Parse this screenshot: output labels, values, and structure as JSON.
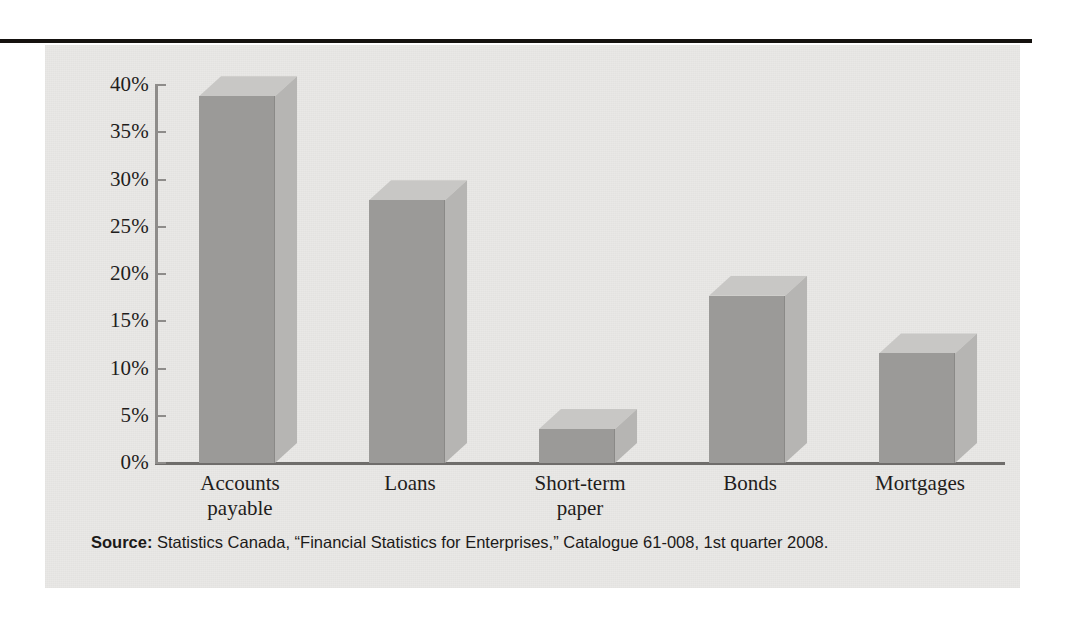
{
  "figure": {
    "background_color": "#e9e8e6",
    "rule_color": "#15120f"
  },
  "source": {
    "label": "Source:",
    "text": " Statistics Canada, “Financial Statistics for Enterprises,” Catalogue 61-008, 1st quarter 2008."
  },
  "chart_data": {
    "type": "bar",
    "title": "",
    "subtitle": "",
    "xlabel": "",
    "ylabel": "",
    "categories": [
      "Accounts payable",
      "Loans",
      "Short-term paper",
      "Bonds",
      "Mortgages"
    ],
    "category_lines": [
      [
        "Accounts",
        "payable"
      ],
      [
        "Loans"
      ],
      [
        "Short-term",
        "paper"
      ],
      [
        "Bonds"
      ],
      [
        "Mortgages"
      ]
    ],
    "values": [
      38.8,
      27.8,
      3.6,
      17.7,
      11.6
    ],
    "value_labels": [
      "",
      "",
      "",
      "",
      ""
    ],
    "ylim": [
      0,
      40
    ],
    "ytick_values": [
      0,
      5,
      10,
      15,
      20,
      25,
      30,
      35,
      40
    ],
    "ytick_labels": [
      "0%",
      "5%",
      "10%",
      "15%",
      "20%",
      "25%",
      "30%",
      "35%",
      "40%"
    ],
    "grid": false,
    "legend": null,
    "style": "3d-column",
    "colors": {
      "bar_front": "#9b9a98",
      "bar_top": "#c8c7c5",
      "bar_side": "#b6b5b3",
      "axis": "#8e8c8a",
      "baseline": "#6f6d6b",
      "text": "#1f1d1c"
    }
  }
}
